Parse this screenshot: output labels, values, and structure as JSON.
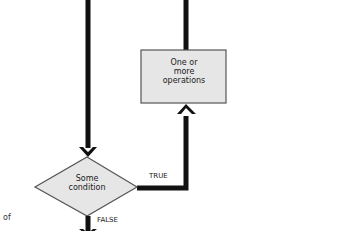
{
  "diagram": {
    "type": "flowchart-fragment",
    "nodes": [
      {
        "id": "process",
        "shape": "rectangle",
        "lines": [
          "One or",
          "more",
          "operations"
        ],
        "fill": "#e6e6e6",
        "stroke": "#555555"
      },
      {
        "id": "decision",
        "shape": "diamond",
        "lines": [
          "Some",
          "condition"
        ],
        "fill": "#e6e6e6",
        "stroke": "#555555"
      }
    ],
    "edges": [
      {
        "from": "above-left",
        "to": "decision",
        "label": ""
      },
      {
        "from": "decision",
        "to": "process",
        "label": "TRUE"
      },
      {
        "from": "process",
        "to": "above-right",
        "label": ""
      },
      {
        "from": "decision",
        "to": "below",
        "label": "FALSE"
      }
    ],
    "edge_labels": {
      "true": "TRUE",
      "false": "FALSE"
    },
    "side_text": "of",
    "colors": {
      "connector": "#111111",
      "node_fill": "#e6e6e6",
      "node_stroke": "#555555",
      "background": "#ffffff"
    }
  }
}
